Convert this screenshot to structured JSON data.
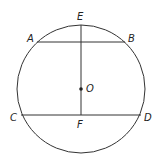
{
  "diagram": {
    "type": "geometry-circle-chords",
    "stroke_color": "#333333",
    "circle": {
      "cx": 81,
      "cy": 89,
      "r": 64,
      "center_label": "O"
    },
    "points": {
      "A": {
        "x": 37,
        "y": 42,
        "label": "A"
      },
      "B": {
        "x": 125,
        "y": 42,
        "label": "B"
      },
      "C": {
        "x": 21,
        "y": 115,
        "label": "C"
      },
      "D": {
        "x": 141,
        "y": 115,
        "label": "D"
      },
      "E": {
        "x": 81,
        "y": 25,
        "label": "E"
      },
      "F": {
        "x": 81,
        "y": 115,
        "label": "F"
      },
      "O": {
        "x": 81,
        "y": 89,
        "label": "O"
      }
    },
    "segments": [
      {
        "name": "AB",
        "from": "A",
        "to": "B"
      },
      {
        "name": "CD",
        "from": "C",
        "to": "D"
      },
      {
        "name": "EF",
        "from": "E",
        "to": "F"
      }
    ],
    "labels": {
      "A": "A",
      "B": "B",
      "C": "C",
      "D": "D",
      "E": "E",
      "F": "F",
      "O": "O"
    }
  }
}
